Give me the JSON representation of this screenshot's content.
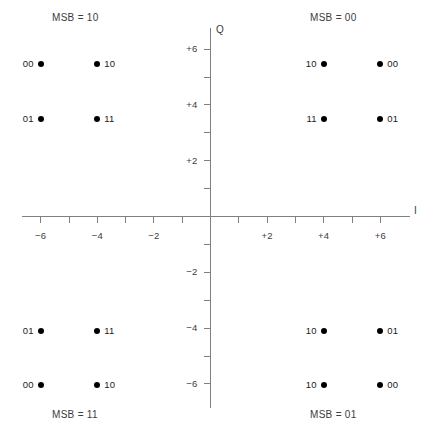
{
  "figure": {
    "axis_labels": {
      "x": "I",
      "y": "Q"
    },
    "axis_color": "#808080",
    "point_color": "#000000",
    "text_color": "#3c3c3c"
  },
  "quadrant_titles": [
    {
      "id": "msb-10",
      "text": "MSB = 10"
    },
    {
      "id": "msb-00",
      "text": "MSB = 00"
    },
    {
      "id": "msb-11",
      "text": "MSB = 11"
    },
    {
      "id": "msb-01",
      "text": "MSB = 01"
    }
  ],
  "x_ticks": [
    {
      "label": "−6",
      "value": -6
    },
    {
      "label": "",
      "value": -5
    },
    {
      "label": "−4",
      "value": -4
    },
    {
      "label": "",
      "value": -3
    },
    {
      "label": "−2",
      "value": -2
    },
    {
      "label": "",
      "value": -1
    },
    {
      "label": "",
      "value": 1
    },
    {
      "label": "+2",
      "value": 2
    },
    {
      "label": "",
      "value": 3
    },
    {
      "label": "+4",
      "value": 4
    },
    {
      "label": "",
      "value": 5
    },
    {
      "label": "+6",
      "value": 6
    }
  ],
  "y_ticks": [
    {
      "label": "+6",
      "value": 6
    },
    {
      "label": "",
      "value": 5
    },
    {
      "label": "+4",
      "value": 4
    },
    {
      "label": "",
      "value": 3
    },
    {
      "label": "+2",
      "value": 2
    },
    {
      "label": "",
      "value": 1
    },
    {
      "label": "",
      "value": -1
    },
    {
      "label": "−2",
      "value": -2
    },
    {
      "label": "",
      "value": -3
    },
    {
      "label": "−4",
      "value": -4
    },
    {
      "label": "",
      "value": -5
    },
    {
      "label": "−6",
      "value": -6
    }
  ],
  "chart_data": {
    "type": "scatter",
    "title": "",
    "xlabel": "I",
    "ylabel": "Q",
    "xlim": [
      -7.4,
      7.6
    ],
    "ylim": [
      -7.5,
      7.0
    ],
    "grid": false,
    "legend": false,
    "note": "16-QAM constellation diagram; each point annotated with its 2 least-significant bits, each quadrant annotated with its 2 most-significant bits",
    "points": [
      {
        "label": "00",
        "label_side": "left",
        "msb": "10",
        "x": -6,
        "y": 5.45
      },
      {
        "label": "10",
        "label_side": "right",
        "msb": "10",
        "x": -4,
        "y": 5.45
      },
      {
        "label": "01",
        "label_side": "left",
        "msb": "10",
        "x": -6,
        "y": 3.5
      },
      {
        "label": "11",
        "label_side": "right",
        "msb": "10",
        "x": -4,
        "y": 3.5
      },
      {
        "label": "10",
        "label_side": "left",
        "msb": "00",
        "x": 4,
        "y": 5.45
      },
      {
        "label": "00",
        "label_side": "right",
        "msb": "00",
        "x": 6,
        "y": 5.45
      },
      {
        "label": "11",
        "label_side": "left",
        "msb": "00",
        "x": 4,
        "y": 3.5
      },
      {
        "label": "01",
        "label_side": "right",
        "msb": "00",
        "x": 6,
        "y": 3.5
      },
      {
        "label": "01",
        "label_side": "left",
        "msb": "11",
        "x": -6,
        "y": -4.1
      },
      {
        "label": "11",
        "label_side": "right",
        "msb": "11",
        "x": -4,
        "y": -4.1
      },
      {
        "label": "10",
        "label_side": "left",
        "msb": "01",
        "x": 4,
        "y": -4.1
      },
      {
        "label": "01",
        "label_side": "right",
        "msb": "01",
        "x": 6,
        "y": -4.1
      },
      {
        "label": "00",
        "label_side": "left",
        "msb": "11",
        "x": -6,
        "y": -6.05
      },
      {
        "label": "10",
        "label_side": "right",
        "msb": "11",
        "x": -4,
        "y": -6.05
      },
      {
        "label": "10",
        "label_side": "left",
        "msb": "01",
        "x": 4,
        "y": -6.05
      },
      {
        "label": "00",
        "label_side": "right",
        "msb": "01",
        "x": 6,
        "y": -6.05
      }
    ]
  }
}
